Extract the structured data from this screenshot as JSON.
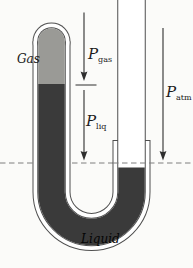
{
  "figure": {
    "type": "closed-tube manometer (U-tube) diagram",
    "labels": {
      "gas": "Gas",
      "liquid": "Liquid",
      "p_gas_main": "P",
      "p_gas_sub": "gas",
      "p_liq_main": "P",
      "p_liq_sub": "liq",
      "p_atm_main": "P",
      "p_atm_sub": "atm"
    },
    "colors": {
      "background": "#fbfbf9",
      "glass_line": "#4f4f4f",
      "gas_fill": "#9a9a96",
      "liquid_fill": "#3a3a3a",
      "dashed_line": "#7f7f7f",
      "arrow": "#2e2e2e",
      "text": "#1a1a1a"
    }
  }
}
